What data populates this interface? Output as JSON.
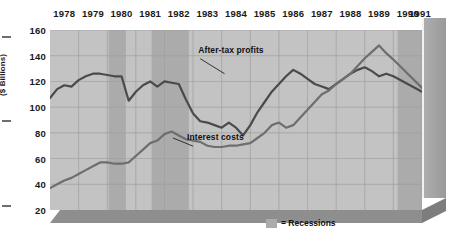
{
  "chart_data": {
    "type": "line",
    "title": "",
    "subtitle": "",
    "xlabel": "",
    "ylabel": "($ Billions)",
    "ylim": [
      20,
      160
    ],
    "yticks": [
      20,
      40,
      60,
      80,
      100,
      120,
      140,
      160
    ],
    "xlim": [
      1978,
      1991
    ],
    "xticks": [
      1978,
      1979,
      1980,
      1981,
      1982,
      1983,
      1984,
      1985,
      1986,
      1987,
      1988,
      1989,
      1990,
      1991
    ],
    "xtick_labels": [
      "1978",
      "1979",
      "1980",
      "1981",
      "1982",
      "1983",
      "1984",
      "1985",
      "1986",
      "1987",
      "1988",
      "1989",
      "1990",
      "1991"
    ],
    "grid": true,
    "legend_position": "inside-bottom-center",
    "legend": [
      {
        "label": "= Recessions",
        "swatch_color": "#ababab",
        "kind": "band"
      }
    ],
    "annotations": [
      {
        "text": "After-tax profits",
        "x": 1983.25,
        "y": 140,
        "points_to_x": 1984.1,
        "points_to_y": 126
      },
      {
        "text": "Interest costs",
        "x": 1983.0,
        "y": 72,
        "points_to_x": 1982.3,
        "points_to_y": 76
      }
    ],
    "bands": [
      {
        "label": "Recession",
        "x0": 1980.05,
        "x1": 1980.65,
        "color": "#ababab"
      },
      {
        "label": "Recession",
        "x0": 1981.55,
        "x1": 1982.85,
        "color": "#ababab"
      },
      {
        "label": "Recession",
        "x0": 1990.15,
        "x1": 1991.0,
        "color": "#ababab"
      }
    ],
    "series": [
      {
        "name": "After-tax profits",
        "color": "#4a4a4a",
        "x": [
          1978.0,
          1978.25,
          1978.5,
          1978.75,
          1979.0,
          1979.25,
          1979.5,
          1979.75,
          1980.0,
          1980.25,
          1980.5,
          1980.75,
          1981.0,
          1981.25,
          1981.5,
          1981.75,
          1982.0,
          1982.25,
          1982.5,
          1982.75,
          1983.0,
          1983.25,
          1983.5,
          1983.75,
          1984.0,
          1984.25,
          1984.5,
          1984.75,
          1985.0,
          1985.25,
          1985.5,
          1985.75,
          1986.0,
          1986.25,
          1986.5,
          1986.75,
          1987.0,
          1987.25,
          1987.5,
          1987.75,
          1988.0,
          1988.25,
          1988.5,
          1988.75,
          1989.0,
          1989.25,
          1989.5,
          1989.75,
          1990.0,
          1990.5,
          1991.0
        ],
        "y": [
          107,
          114,
          117,
          116,
          121,
          124,
          126,
          126,
          125,
          124,
          124,
          105,
          112,
          117,
          120,
          116,
          120,
          119,
          118,
          106,
          95,
          89,
          88,
          86,
          84,
          88,
          84,
          78,
          86,
          96,
          104,
          112,
          118,
          124,
          129,
          126,
          122,
          118,
          116,
          114,
          118,
          122,
          126,
          129,
          131,
          128,
          124,
          126,
          124,
          118,
          112
        ]
      },
      {
        "name": "Interest costs",
        "color": "#6e6e6e",
        "x": [
          1978.0,
          1978.25,
          1978.5,
          1978.75,
          1979.0,
          1979.25,
          1979.5,
          1979.75,
          1980.0,
          1980.25,
          1980.5,
          1980.75,
          1981.0,
          1981.25,
          1981.5,
          1981.75,
          1982.0,
          1982.25,
          1982.5,
          1982.75,
          1983.0,
          1983.25,
          1983.5,
          1983.75,
          1984.0,
          1984.25,
          1984.5,
          1984.75,
          1985.0,
          1985.25,
          1985.5,
          1985.75,
          1986.0,
          1986.25,
          1986.5,
          1986.75,
          1987.0,
          1987.25,
          1987.5,
          1987.75,
          1988.0,
          1988.25,
          1988.5,
          1988.75,
          1989.0,
          1989.25,
          1989.5,
          1989.75,
          1990.0,
          1990.5,
          1991.0
        ],
        "y": [
          37,
          40,
          43,
          45,
          48,
          51,
          54,
          57,
          57,
          56,
          56,
          57,
          62,
          67,
          72,
          74,
          79,
          81,
          78,
          75,
          74,
          73,
          70,
          69,
          69,
          70,
          70,
          71,
          72,
          76,
          80,
          86,
          88,
          84,
          86,
          92,
          98,
          104,
          110,
          113,
          118,
          122,
          126,
          132,
          138,
          143,
          148,
          142,
          137,
          126,
          115
        ]
      }
    ]
  },
  "axis": {
    "ylabel": "($ Billions)",
    "ytick_labels": [
      "160",
      "140",
      "120",
      "100",
      "80",
      "60",
      "40",
      "20"
    ],
    "xtick_labels": [
      "1978",
      "1979",
      "1980",
      "1981",
      "1982",
      "1983",
      "1984",
      "1985",
      "1986",
      "1987",
      "1988",
      "1989",
      "1990",
      "1991"
    ]
  },
  "annotations": {
    "profits_label": "After-tax profits",
    "interest_label": "Interest costs"
  },
  "legend": {
    "recessions_label": "= Recessions"
  },
  "colors": {
    "plot_background": "#c3c3c3",
    "recession_band": "#ababab",
    "gridline": "#9e9e9e",
    "profits_line": "#4a4a4a",
    "interest_line": "#6e6e6e",
    "text": "#1a1a1a"
  }
}
